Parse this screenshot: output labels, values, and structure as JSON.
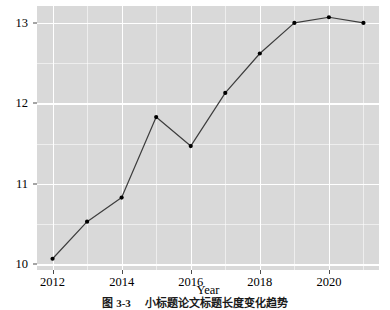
{
  "chart_data": {
    "type": "line",
    "title": "",
    "xlabel": "Year",
    "ylabel": "Mean of title length",
    "x": [
      2012,
      2013,
      2014,
      2015,
      2016,
      2017,
      2018,
      2019,
      2020,
      2021
    ],
    "values": [
      10.07,
      10.53,
      10.83,
      11.83,
      11.47,
      12.13,
      12.62,
      13.0,
      13.07,
      13.0
    ],
    "series": [
      {
        "name": "Mean of title length",
        "values": [
          10.07,
          10.53,
          10.83,
          11.83,
          11.47,
          12.13,
          12.62,
          13.0,
          13.07,
          13.0
        ]
      }
    ],
    "xlim": [
      2011.55,
      2021.45
    ],
    "ylim": [
      9.93,
      13.21
    ],
    "xticks": [
      2012,
      2014,
      2016,
      2018,
      2020
    ],
    "xtick_labels": [
      "2012",
      "2014",
      "2016",
      "2018",
      "2020"
    ],
    "yticks": [
      10,
      11,
      12,
      13
    ],
    "ytick_labels": [
      "10",
      "11",
      "12",
      "13"
    ],
    "y_minor_ticks": [
      10.5,
      11.5,
      12.5
    ],
    "x_minor_ticks": [
      2013,
      2015,
      2017,
      2019,
      2021
    ],
    "grid": true,
    "legend": false,
    "legend_position": "none",
    "line_color": "#3d3d3d",
    "point_color": "#000000",
    "panel_background": "#d9d9d9",
    "grid_color": "#ffffff"
  },
  "caption": {
    "text": "图 3-3  　小标题论文标题长度变化趋势"
  }
}
